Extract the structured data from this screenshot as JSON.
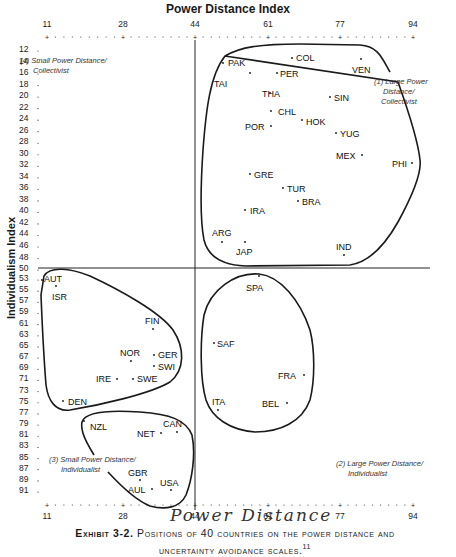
{
  "chart_data": {
    "type": "scatter",
    "title": "Power Distance Index",
    "xlabel": "Power Distance Index",
    "ylabel": "Individualism Index",
    "x_ticks": [
      11,
      28,
      44,
      61,
      77,
      94
    ],
    "y_ticks": [
      12,
      14,
      16,
      18,
      20,
      22,
      24,
      26,
      28,
      30,
      32,
      34,
      36,
      38,
      40,
      42,
      44,
      46,
      48,
      50,
      53,
      55,
      57,
      59,
      61,
      63,
      65,
      67,
      69,
      71,
      73,
      75,
      77,
      79,
      81,
      83,
      85,
      87,
      89,
      91
    ],
    "xlim": [
      11,
      94
    ],
    "ylim": [
      12,
      91
    ],
    "divider_x": 44,
    "divider_y": 50,
    "quadrants": [
      {
        "id": 1,
        "label": "(1) Large Power Distance/ Collectivist"
      },
      {
        "id": 2,
        "label": "(2) Large Power Distance/ Individualist"
      },
      {
        "id": 3,
        "label": "(3) Small Power Distance/ Individualist"
      },
      {
        "id": 4,
        "label": "(4) Small Power Distance/ Collectivist"
      }
    ],
    "points": [
      {
        "label": "PAK",
        "px": 223,
        "py": 63,
        "lx": 228,
        "ly": 66
      },
      {
        "label": "COL",
        "px": 292,
        "py": 58,
        "lx": 296,
        "ly": 61
      },
      {
        "label": "VEN",
        "px": 361,
        "py": 59,
        "lx": 352,
        "ly": 73
      },
      {
        "label": "TAI",
        "px": 250,
        "py": 73,
        "lx": 214,
        "ly": 87
      },
      {
        "label": "PER",
        "px": 277,
        "py": 73,
        "lx": 280,
        "ly": 77
      },
      {
        "label": "THA",
        "px": 270,
        "py": 93,
        "lx": 262,
        "ly": 97
      },
      {
        "label": "SIN",
        "px": 330,
        "py": 97,
        "lx": 334,
        "ly": 101
      },
      {
        "label": "CHL",
        "px": 271,
        "py": 111,
        "lx": 278,
        "ly": 115
      },
      {
        "label": "HOK",
        "px": 302,
        "py": 120,
        "lx": 306,
        "ly": 125
      },
      {
        "label": "POR",
        "px": 271,
        "py": 126,
        "lx": 245,
        "ly": 130
      },
      {
        "label": "YUG",
        "px": 336,
        "py": 133,
        "lx": 340,
        "ly": 137
      },
      {
        "label": "MEX",
        "px": 362,
        "py": 155,
        "lx": 336,
        "ly": 159
      },
      {
        "label": "PHI",
        "px": 412,
        "py": 163,
        "lx": 392,
        "ly": 167
      },
      {
        "label": "GRE",
        "px": 250,
        "py": 174,
        "lx": 254,
        "ly": 178
      },
      {
        "label": "TUR",
        "px": 283,
        "py": 188,
        "lx": 287,
        "ly": 192
      },
      {
        "label": "BRA",
        "px": 298,
        "py": 201,
        "lx": 302,
        "ly": 205
      },
      {
        "label": "IRA",
        "px": 245,
        "py": 210,
        "lx": 250,
        "ly": 214
      },
      {
        "label": "ARG",
        "px": 222,
        "py": 242,
        "lx": 212,
        "ly": 236
      },
      {
        "label": "JAP",
        "px": 245,
        "py": 242,
        "lx": 236,
        "ly": 255
      },
      {
        "label": "IND",
        "px": 344,
        "py": 255,
        "lx": 336,
        "ly": 250
      },
      {
        "label": "AUT",
        "px": 42,
        "py": 280,
        "lx": 44,
        "ly": 282
      },
      {
        "label": "ISR",
        "px": 56,
        "py": 286,
        "lx": 52,
        "ly": 300
      },
      {
        "label": "FIN",
        "px": 153,
        "py": 329,
        "lx": 145,
        "ly": 324
      },
      {
        "label": "NOR",
        "px": 131,
        "py": 361,
        "lx": 120,
        "ly": 356
      },
      {
        "label": "GER",
        "px": 154,
        "py": 355,
        "lx": 158,
        "ly": 358
      },
      {
        "label": "SWI",
        "px": 154,
        "py": 366,
        "lx": 158,
        "ly": 370
      },
      {
        "label": "IRE",
        "px": 117,
        "py": 379,
        "lx": 96,
        "ly": 382
      },
      {
        "label": "SWE",
        "px": 133,
        "py": 379,
        "lx": 137,
        "ly": 382
      },
      {
        "label": "DEN",
        "px": 63,
        "py": 401,
        "lx": 68,
        "ly": 405
      },
      {
        "label": "NZL",
        "px": 84,
        "py": 421,
        "lx": 90,
        "ly": 430
      },
      {
        "label": "NET",
        "px": 161,
        "py": 433,
        "lx": 137,
        "ly": 437
      },
      {
        "label": "CAN",
        "px": 177,
        "py": 432,
        "lx": 163,
        "ly": 427
      },
      {
        "label": "GBR",
        "px": 140,
        "py": 480,
        "lx": 128,
        "ly": 476
      },
      {
        "label": "USA",
        "px": 171,
        "py": 490,
        "lx": 160,
        "ly": 486
      },
      {
        "label": "AUL",
        "px": 152,
        "py": 489,
        "lx": 128,
        "ly": 493
      },
      {
        "label": "SPA",
        "px": 259,
        "py": 276,
        "lx": 246,
        "ly": 291
      },
      {
        "label": "SAF",
        "px": 214,
        "py": 343,
        "lx": 217,
        "ly": 347
      },
      {
        "label": "FRA",
        "px": 304,
        "py": 375,
        "lx": 278,
        "ly": 379
      },
      {
        "label": "ITA",
        "px": 218,
        "py": 410,
        "lx": 212,
        "ly": 405
      },
      {
        "label": "BEL",
        "px": 287,
        "py": 403,
        "lx": 262,
        "ly": 407
      }
    ],
    "grid": false,
    "legend_position": "none"
  },
  "labels": {
    "title": "Power Distance Index",
    "ylabel": "Individualism Index",
    "handwriting": "Power Distance",
    "caption_prefix": "Exhibit 3-2.",
    "caption_line1": " Positions of 40 countries on the power distance and",
    "caption_line2": "uncertainty avoidance scales.",
    "caption_footnote": "11",
    "q1_line1": "(1) Large Power",
    "q1_line2": "Distance/",
    "q1_line3": "Collectivist",
    "q2_line1": "(2) Large Power Distance/",
    "q2_line2": "Individualist",
    "q3_line1": "(3) Small Power Distance/",
    "q3_line2": "Individualist",
    "q4_line1": "(4) Small Power Distance/",
    "q4_line2": "Collectivist"
  }
}
